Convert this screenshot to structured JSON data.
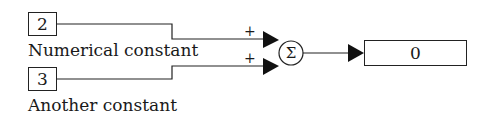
{
  "diagram": {
    "constants": [
      {
        "value": "2",
        "label": "Numerical constant",
        "sign": "+"
      },
      {
        "value": "3",
        "label": "Another constant",
        "sign": "+"
      }
    ],
    "sum_block": {
      "symbol": "Σ",
      "icon": "sum-icon"
    },
    "display": {
      "value": "0"
    },
    "colors": {
      "line": "#222222",
      "background": "#ffffff"
    }
  }
}
